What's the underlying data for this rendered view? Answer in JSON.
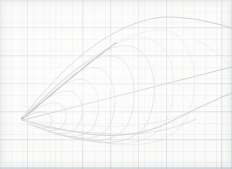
{
  "figure": {
    "medium": "pencil on graph paper",
    "canvas": {
      "width": 232,
      "height": 169
    }
  },
  "paper": {
    "background_color": "#fbfbfa",
    "minor_grid_color": "#7a8796",
    "major_grid_color": "#69788c",
    "minor_grid_spacing_px": 5.6,
    "major_grid_spacing_px": 28,
    "grid_visible": true
  },
  "ink": {
    "dark_color": "#3f4043",
    "mid_color": "#7e8186",
    "light_color": "#9a9da1",
    "faint_color": "#b0b3b6"
  },
  "chart_data": {
    "type": "line",
    "xlabel": "",
    "ylabel": "",
    "xlim": [
      0,
      232
    ],
    "ylim": [
      169,
      0
    ],
    "grid": true,
    "legend": "none",
    "apex_point": {
      "x": 22,
      "y": 118
    },
    "series": [
      {
        "name": "outer-upper-envelope-arc",
        "weight": "mid",
        "path": "M22,118 C40,96 62,70 88,50 C112,32 140,18 166,17 C190,17 212,22 232,28"
      },
      {
        "name": "dark-chord-upper",
        "weight": "dark",
        "path": "M22,119 C44,101 70,78 96,58 C104,52 110,47 116,43"
      },
      {
        "name": "long-straight-chord",
        "weight": "mid",
        "path": "M23,120 L232,67"
      },
      {
        "name": "lower-envelope-curve",
        "weight": "mid",
        "path": "M22,120 C44,126 70,132 98,135 C124,137 148,133 170,122 C192,111 214,100 232,93"
      },
      {
        "name": "lens-rib-1",
        "weight": "light",
        "path": "M22,119 C34,112 42,110 48,114 C53,118 53,122 50,126 C46,130 38,128 30,124"
      },
      {
        "name": "lens-rib-2",
        "weight": "light",
        "path": "M22,119 C38,106 52,100 60,104 C68,109 68,120 62,127 C56,133 44,131 34,126"
      },
      {
        "name": "lens-rib-3",
        "weight": "light",
        "path": "M22,119 C42,100 60,88 72,92 C84,97 85,114 78,126 C71,136 56,135 42,129"
      },
      {
        "name": "lens-rib-4",
        "weight": "light",
        "path": "M22,119 C48,93 70,76 85,80 C100,85 102,110 94,126 C86,139 66,139 48,131"
      },
      {
        "name": "lens-rib-5",
        "weight": "light",
        "path": "M22,119 C54,86 80,64 98,68 C116,73 119,105 110,125 C101,141 78,142 56,133"
      },
      {
        "name": "lens-rib-6",
        "weight": "light",
        "path": "M22,119 C60,80 92,52 114,56 C136,61 139,100 128,124 C117,143 90,145 64,135"
      },
      {
        "name": "lens-rib-7",
        "weight": "light",
        "path": "M22,119 C66,74 104,42 130,46 C156,51 160,96 147,123 C134,145 102,147 72,136"
      },
      {
        "name": "lens-rib-8",
        "weight": "faint",
        "path": "M22,119 C72,68 116,34 146,38 C176,43 180,92 166,121 C152,146 114,149 80,137"
      },
      {
        "name": "lens-rib-9",
        "weight": "faint",
        "path": "M22,119 C78,64 128,28 162,30 C196,33 202,88 186,119 C170,147 126,151 88,138"
      },
      {
        "name": "cross-tie-low",
        "weight": "light",
        "path": "M26,124 C52,129 84,133 116,134 C146,135 172,130 196,119"
      },
      {
        "name": "cross-tie-mid",
        "weight": "faint",
        "path": "M30,121 C60,124 94,127 126,126 C154,125 178,118 200,107"
      },
      {
        "name": "tip-fold-right",
        "weight": "faint",
        "path": "M196,40 C212,48 224,58 232,68"
      }
    ],
    "annotations": []
  }
}
